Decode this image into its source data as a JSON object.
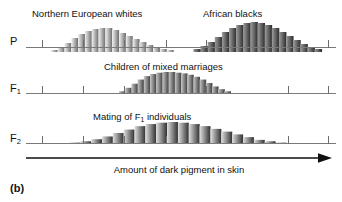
{
  "figure": {
    "panel_label": "(b)",
    "x_axis_title": "Amount of dark pigment in skin",
    "background_color": "#ffffff",
    "axis_color": "#7a7a7a",
    "text_color": "#111111"
  },
  "rows": [
    {
      "id": "P",
      "label": "P",
      "label_sub": "",
      "captions": [
        "Northern European whites",
        "African blacks"
      ]
    },
    {
      "id": "F1",
      "label": "F",
      "label_sub": "1",
      "captions": [
        "Children of mixed marriages"
      ]
    },
    {
      "id": "F2",
      "label": "F",
      "label_sub": "2",
      "captions": [
        "Mating of F",
        "1",
        " individuals"
      ]
    }
  ],
  "captions": {
    "p_left": "Northern European whites",
    "p_right": "African blacks",
    "f1": "Children of mixed marriages",
    "f2_pre": "Mating of F",
    "f2_sub": "1",
    "f2_post": " individuals"
  },
  "chart_data": {
    "type": "bar",
    "xlabel": "Amount of dark pigment in skin",
    "ylabel": "",
    "grid": false,
    "legend": "none",
    "axis_range_x": [
      0,
      100
    ],
    "tick_positions": [
      5,
      18.5,
      31.5,
      45,
      58,
      84.5,
      97.5
    ],
    "series": [
      {
        "name": "Northern European whites",
        "row": "P",
        "shade_start": "#f2f2f2",
        "shade_end": "#6b6b6b",
        "x_start": 8,
        "x_end": 46,
        "bins": [
          {
            "x": 8.0,
            "h": 2
          },
          {
            "x": 10.2,
            "h": 5
          },
          {
            "x": 12.4,
            "h": 9
          },
          {
            "x": 14.6,
            "h": 14
          },
          {
            "x": 16.8,
            "h": 18
          },
          {
            "x": 19.0,
            "h": 21
          },
          {
            "x": 21.2,
            "h": 23
          },
          {
            "x": 23.4,
            "h": 24
          },
          {
            "x": 25.6,
            "h": 24
          },
          {
            "x": 27.8,
            "h": 22
          },
          {
            "x": 30.0,
            "h": 19
          },
          {
            "x": 32.2,
            "h": 16
          },
          {
            "x": 34.4,
            "h": 13
          },
          {
            "x": 36.6,
            "h": 10
          },
          {
            "x": 38.8,
            "h": 7
          },
          {
            "x": 41.0,
            "h": 5
          },
          {
            "x": 43.2,
            "h": 3
          },
          {
            "x": 45.4,
            "h": 2
          }
        ]
      },
      {
        "name": "African blacks",
        "row": "P",
        "shade_start": "#9e9e9e",
        "shade_end": "#2a2a2a",
        "x_start": 54,
        "x_end": 95,
        "bins": [
          {
            "x": 54.0,
            "h": 3
          },
          {
            "x": 56.3,
            "h": 6
          },
          {
            "x": 58.6,
            "h": 10
          },
          {
            "x": 60.9,
            "h": 15
          },
          {
            "x": 63.2,
            "h": 20
          },
          {
            "x": 65.5,
            "h": 24
          },
          {
            "x": 67.8,
            "h": 27
          },
          {
            "x": 70.1,
            "h": 29
          },
          {
            "x": 72.4,
            "h": 30
          },
          {
            "x": 74.7,
            "h": 29
          },
          {
            "x": 77.0,
            "h": 27
          },
          {
            "x": 79.3,
            "h": 24
          },
          {
            "x": 81.6,
            "h": 20
          },
          {
            "x": 83.9,
            "h": 16
          },
          {
            "x": 86.2,
            "h": 12
          },
          {
            "x": 88.5,
            "h": 8
          },
          {
            "x": 90.8,
            "h": 5
          },
          {
            "x": 93.1,
            "h": 3
          }
        ]
      },
      {
        "name": "Children of mixed marriages",
        "row": "F1",
        "shade_start": "#c8c8c8",
        "shade_end": "#3d3d3d",
        "x_start": 30,
        "x_end": 66,
        "bins": [
          {
            "x": 30.0,
            "h": 4
          },
          {
            "x": 32.0,
            "h": 9
          },
          {
            "x": 34.0,
            "h": 15
          },
          {
            "x": 36.0,
            "h": 21
          },
          {
            "x": 38.0,
            "h": 26
          },
          {
            "x": 40.0,
            "h": 29
          },
          {
            "x": 42.0,
            "h": 31
          },
          {
            "x": 44.0,
            "h": 32
          },
          {
            "x": 46.0,
            "h": 32
          },
          {
            "x": 48.0,
            "h": 31
          },
          {
            "x": 50.0,
            "h": 30
          },
          {
            "x": 52.0,
            "h": 28
          },
          {
            "x": 54.0,
            "h": 25
          },
          {
            "x": 56.0,
            "h": 21
          },
          {
            "x": 58.0,
            "h": 16
          },
          {
            "x": 60.0,
            "h": 11
          },
          {
            "x": 62.0,
            "h": 7
          },
          {
            "x": 64.0,
            "h": 4
          }
        ]
      },
      {
        "name": "Mating of F1 individuals",
        "row": "F2",
        "shade_start": "#e0e0e0",
        "shade_end": "#303030",
        "x_start": 14,
        "x_end": 82,
        "bins": [
          {
            "x": 14.0,
            "h": 2
          },
          {
            "x": 17.5,
            "h": 4
          },
          {
            "x": 21.0,
            "h": 7
          },
          {
            "x": 24.5,
            "h": 11
          },
          {
            "x": 28.0,
            "h": 16
          },
          {
            "x": 31.5,
            "h": 21
          },
          {
            "x": 35.0,
            "h": 26
          },
          {
            "x": 38.5,
            "h": 29
          },
          {
            "x": 42.0,
            "h": 31
          },
          {
            "x": 45.5,
            "h": 32
          },
          {
            "x": 49.0,
            "h": 31
          },
          {
            "x": 52.5,
            "h": 29
          },
          {
            "x": 56.0,
            "h": 26
          },
          {
            "x": 59.5,
            "h": 22
          },
          {
            "x": 63.0,
            "h": 18
          },
          {
            "x": 66.5,
            "h": 14
          },
          {
            "x": 70.0,
            "h": 10
          },
          {
            "x": 73.5,
            "h": 6
          },
          {
            "x": 77.0,
            "h": 4
          },
          {
            "x": 80.5,
            "h": 2
          }
        ]
      }
    ]
  }
}
